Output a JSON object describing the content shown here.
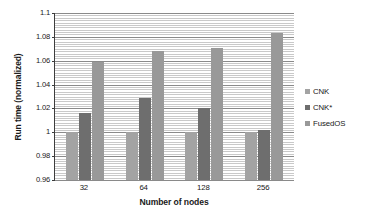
{
  "chart_data": {
    "type": "bar",
    "title": "",
    "xlabel": "Number of nodes",
    "ylabel": "Run time (normalized)",
    "categories": [
      "32",
      "64",
      "128",
      "256"
    ],
    "series": [
      {
        "name": "CNK",
        "values": [
          1.0,
          1.0,
          1.0,
          1.0
        ],
        "color": "#a3a3a3"
      },
      {
        "name": "CNK*",
        "values": [
          1.016,
          1.029,
          1.02,
          1.002
        ],
        "color": "#6e6e6e"
      },
      {
        "name": "FusedOS",
        "values": [
          1.059,
          1.068,
          1.071,
          1.083
        ],
        "color": "#999999"
      }
    ],
    "ylim": [
      0.96,
      1.1
    ],
    "ytick_labels": [
      "0.96",
      "0.98",
      "1",
      "1.02",
      "1.04",
      "1.06",
      "1.08",
      "1.1"
    ],
    "ytick_values": [
      0.96,
      0.98,
      1.0,
      1.02,
      1.04,
      1.06,
      1.08,
      1.1
    ],
    "minor_tick_step": 0.002,
    "grid": "horizontal-major-and-minor",
    "legend_position": "right",
    "legend": [
      "CNK",
      "CNK*",
      "FusedOS"
    ]
  }
}
